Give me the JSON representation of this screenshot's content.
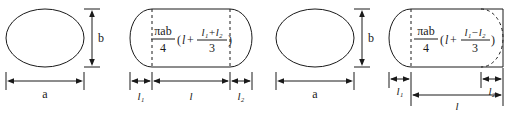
{
  "diagram": {
    "stroke_color": "#1a1a1a",
    "background_color": "#ffffff",
    "figures": [
      {
        "id": "fig1-ellipse-cross-section",
        "shape": "ellipse",
        "labels": {
          "width": "a",
          "height": "b"
        }
      },
      {
        "id": "fig2-capsule-two-caps",
        "shape": "capsule-both-ends-rounded",
        "formula": {
          "numerator": "πab",
          "denominator": "4",
          "open_paren": "(",
          "main_term": "l",
          "plus": "+",
          "frac_numerator": "l₁+l₂",
          "frac_denominator": "3",
          "close_paren": ")",
          "plain_text": "(πab/4)(l + (l₁+l₂)/3)"
        },
        "labels": {
          "left_segment": "l₁",
          "middle_segment": "l",
          "right_segment": "l₂"
        }
      },
      {
        "id": "fig3-ellipse-cross-section",
        "shape": "ellipse",
        "labels": {
          "width": "a",
          "height": "b"
        }
      },
      {
        "id": "fig4-capsule-one-cap",
        "shape": "capsule-left-rounded-right-flat-with-dashed-arc",
        "formula": {
          "numerator": "πab",
          "denominator": "4",
          "open_paren": "(",
          "main_term": "l",
          "plus": "+",
          "frac_numerator": "l₁−l₂",
          "frac_denominator": "3",
          "close_paren": ")",
          "plain_text": "(πab/4)(l + (l₁−l₂)/3)"
        },
        "labels": {
          "left_segment": "l₁",
          "right_segment": "l₂",
          "total_segment": "l"
        }
      }
    ]
  }
}
